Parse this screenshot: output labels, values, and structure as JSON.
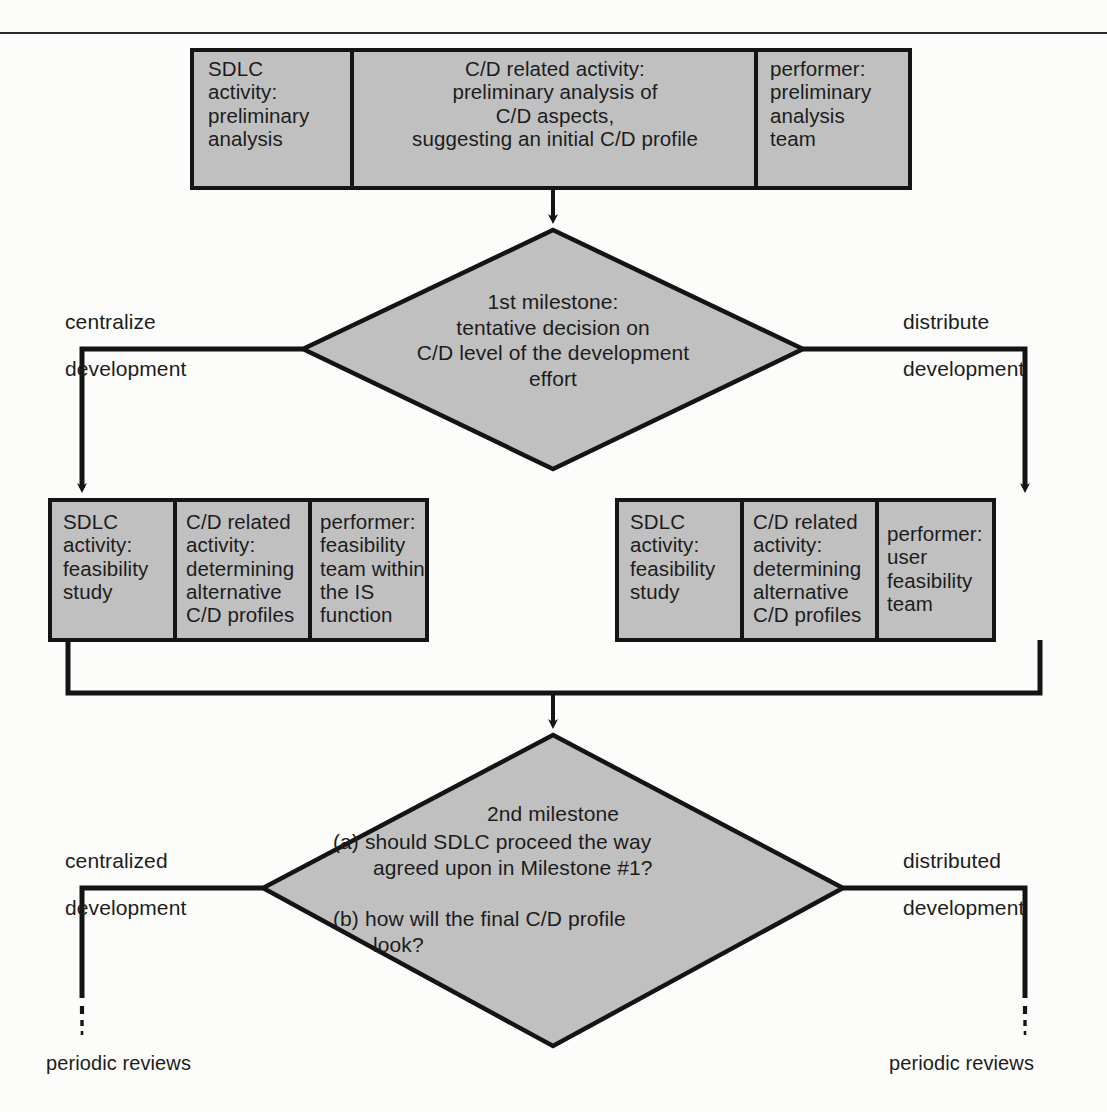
{
  "diagram": {
    "fill_color": "#c0c0c0",
    "stroke_color": "#141414",
    "background_color": "#fcfcfa",
    "top_rule": true
  },
  "top_box": {
    "columns": [
      {
        "label": "sdlc-activity",
        "lines": "SDLC\nactivity:\npreliminary\nanalysis",
        "align": "left"
      },
      {
        "label": "cd-related-activity",
        "lines": "C/D related activity:\npreliminary analysis of\nC/D aspects,\nsuggesting an initial C/D profile",
        "align": "center"
      },
      {
        "label": "performer",
        "lines": "performer:\npreliminary\nanalysis\nteam",
        "align": "left"
      }
    ]
  },
  "milestone1": {
    "lines": "1st milestone:\ntentative decision on\nC/D level of the development\neffort"
  },
  "branch1": {
    "left_top": "centralize",
    "left_bottom": "development",
    "right_top": "distribute",
    "right_bottom": "development"
  },
  "left_box": {
    "columns": [
      {
        "label": "sdlc-activity",
        "lines": "SDLC\nactivity:\nfeasibility\nstudy"
      },
      {
        "label": "cd-related-activity",
        "lines": "C/D related\nactivity:\ndetermining\nalternative\nC/D profiles"
      },
      {
        "label": "performer",
        "lines": "performer:\nfeasibility\nteam within\nthe IS\nfunction"
      }
    ]
  },
  "right_box": {
    "columns": [
      {
        "label": "sdlc-activity",
        "lines": "SDLC\nactivity:\nfeasibility\nstudy"
      },
      {
        "label": "cd-related-activity",
        "lines": "C/D related\nactivity:\ndetermining\nalternative\nC/D profiles"
      },
      {
        "label": "performer",
        "lines": "performer:\nuser\nfeasibility\nteam"
      }
    ]
  },
  "milestone2": {
    "heading": "2nd milestone",
    "line_a1": "(a) should SDLC proceed the way",
    "line_a2": "agreed upon in Milestone #1?",
    "line_b1": "(b) how will the final C/D profile",
    "line_b2": "look?"
  },
  "branch2": {
    "left_top": "centralized",
    "left_bottom": "development",
    "right_top": "distributed",
    "right_bottom": "development"
  },
  "terminals": {
    "left": "periodic reviews",
    "right": "periodic reviews"
  }
}
